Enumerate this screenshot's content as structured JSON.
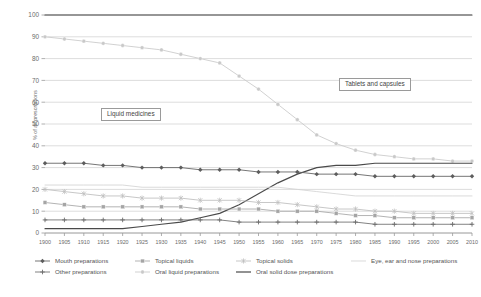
{
  "chart_data": {
    "type": "line",
    "title": "",
    "xlabel": "",
    "ylabel": "% of all prescriptions",
    "ylim": [
      0,
      100
    ],
    "yticks": [
      0,
      10,
      20,
      30,
      40,
      50,
      60,
      70,
      80,
      90,
      100
    ],
    "grid": true,
    "legend_position": "bottom",
    "categories": [
      1900,
      1905,
      1910,
      1915,
      1920,
      1925,
      1930,
      1935,
      1940,
      1945,
      1950,
      1955,
      1960,
      1965,
      1970,
      1975,
      1980,
      1985,
      1990,
      1995,
      2000,
      2005,
      2010
    ],
    "annotations": [
      {
        "text": "Liquid medicines",
        "near_series": "Oral liquid preparations"
      },
      {
        "text": "Tablets and capsules",
        "near_series": "Oral solid dose preparations"
      }
    ],
    "series": [
      {
        "name": "Total",
        "marker": "none",
        "color": "#3f3f3f",
        "values": [
          100,
          100,
          100,
          100,
          100,
          100,
          100,
          100,
          100,
          100,
          100,
          100,
          100,
          100,
          100,
          100,
          100,
          100,
          100,
          100,
          100,
          100,
          100
        ]
      },
      {
        "name": "Oral liquid preparations",
        "marker": "circle",
        "color": "#c9c9c9",
        "values": [
          90,
          89,
          88,
          87,
          86,
          85,
          84,
          82,
          80,
          78,
          72,
          66,
          59,
          52,
          45,
          41,
          38,
          36,
          35,
          34,
          34,
          33,
          33
        ]
      },
      {
        "name": "Oral solid dose preparations",
        "marker": "none",
        "color": "#4a4a4a",
        "values": [
          2,
          2,
          2,
          2,
          2,
          3,
          4,
          5,
          7,
          9,
          13,
          18,
          23,
          27,
          30,
          31,
          31,
          32,
          32,
          32,
          32,
          32,
          32
        ]
      },
      {
        "name": "Mouth preparations",
        "marker": "diamond",
        "color": "#5d5d5d",
        "values": [
          32,
          32,
          32,
          31,
          31,
          30,
          30,
          30,
          29,
          29,
          29,
          28,
          28,
          28,
          27,
          27,
          27,
          26,
          26,
          26,
          26,
          26,
          26
        ]
      },
      {
        "name": "Eye, ear and nose preparations",
        "marker": "none",
        "color": "#d3d3d3",
        "values": [
          22,
          22,
          22,
          22,
          22,
          21,
          21,
          21,
          21,
          21,
          21,
          21,
          21,
          20,
          19,
          18,
          17,
          17,
          17,
          17,
          17,
          17,
          17
        ]
      },
      {
        "name": "Topical solids",
        "marker": "star",
        "color": "#bdbdbd",
        "values": [
          20,
          19,
          18,
          17,
          17,
          16,
          16,
          16,
          15,
          15,
          15,
          14,
          14,
          13,
          12,
          11,
          11,
          10,
          10,
          9,
          9,
          9,
          9
        ]
      },
      {
        "name": "Topical liquids",
        "marker": "square",
        "color": "#a5a5a5",
        "values": [
          14,
          13,
          12,
          12,
          12,
          12,
          12,
          12,
          11,
          11,
          11,
          11,
          10,
          10,
          10,
          9,
          8,
          8,
          7,
          7,
          7,
          7,
          7
        ]
      },
      {
        "name": "Other preparations",
        "marker": "plus",
        "color": "#6b6b6b",
        "values": [
          6,
          6,
          6,
          6,
          6,
          6,
          6,
          6,
          6,
          6,
          5,
          5,
          5,
          5,
          5,
          5,
          5,
          4,
          4,
          4,
          4,
          4,
          4
        ]
      }
    ]
  },
  "legend": {
    "items": [
      {
        "label": "Mouth preparations",
        "marker": "diamond",
        "color": "#5d5d5d"
      },
      {
        "label": "Topical liquids",
        "marker": "square",
        "color": "#a5a5a5"
      },
      {
        "label": "Topical solids",
        "marker": "star",
        "color": "#bdbdbd"
      },
      {
        "label": "Eye, ear and nose preparations",
        "marker": "none",
        "color": "#d3d3d3"
      },
      {
        "label": "Other preparations",
        "marker": "plus",
        "color": "#6b6b6b"
      },
      {
        "label": "Oral liquid preparations",
        "marker": "circle",
        "color": "#c9c9c9"
      },
      {
        "label": "Oral solid dose preparations",
        "marker": "none",
        "color": "#4a4a4a"
      }
    ]
  },
  "callouts": {
    "liquid": "Liquid medicines",
    "tablets": "Tablets and capsules"
  },
  "axis": {
    "y_title": "% of all prescriptions"
  }
}
